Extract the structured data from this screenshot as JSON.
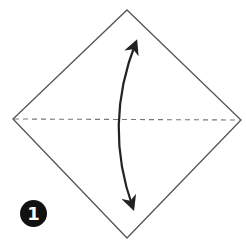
{
  "diagram": {
    "type": "origami-fold-step",
    "step_number": "1",
    "paper": {
      "shape": "square-diamond",
      "vertices": {
        "top": [
          127,
          10
        ],
        "left": [
          13,
          119
        ],
        "right": [
          241,
          120
        ],
        "bottom": [
          127,
          238
        ]
      },
      "stroke": "#555555"
    },
    "fold_line": {
      "style": "valley-dashed",
      "from": [
        13,
        119
      ],
      "to": [
        241,
        120
      ],
      "color": "#777777"
    },
    "arrow": {
      "kind": "double-headed-curved",
      "from": [
        133,
        40
      ],
      "to": [
        133,
        210
      ],
      "color": "#222222",
      "meaning": "fold top corner down to bottom corner and unfold"
    },
    "badge": {
      "center": [
        33,
        213
      ],
      "radius": 13,
      "color": "#111111",
      "text_color": "#ffffff"
    }
  }
}
